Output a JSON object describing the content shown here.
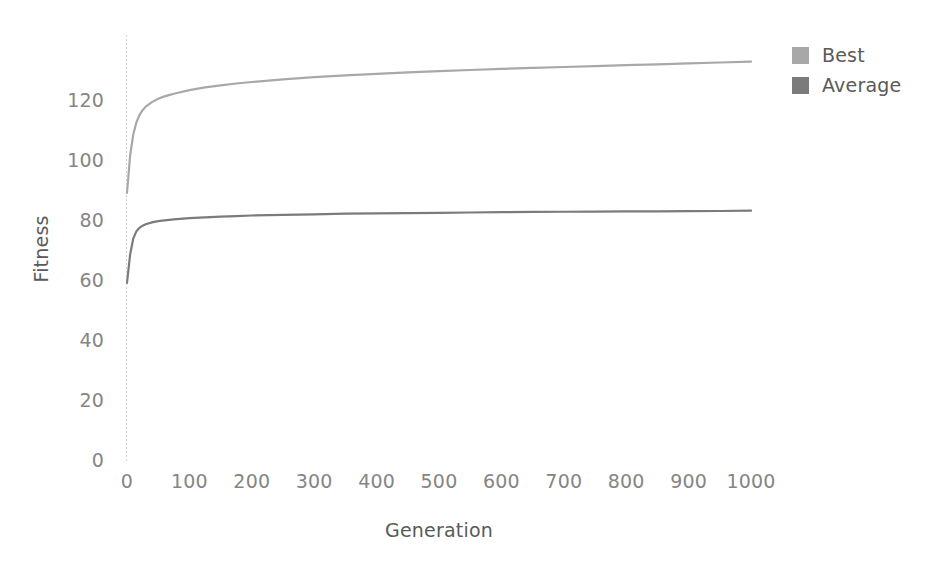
{
  "chart_data": {
    "type": "line",
    "title": "",
    "xlabel": "Generation",
    "ylabel": "Fitness",
    "xlim": [
      0,
      1000
    ],
    "ylim": [
      0,
      140
    ],
    "xticks": [
      "0",
      "100",
      "200",
      "300",
      "400",
      "500",
      "600",
      "700",
      "800",
      "900",
      "1000"
    ],
    "xtick_values": [
      0,
      100,
      200,
      300,
      400,
      500,
      600,
      700,
      800,
      900,
      1000
    ],
    "yticks": [
      "0",
      "20",
      "40",
      "60",
      "80",
      "100",
      "120"
    ],
    "ytick_values": [
      0,
      20,
      40,
      60,
      80,
      100,
      120
    ],
    "grid": false,
    "legend_position": "top-right",
    "x": [
      0,
      5,
      10,
      15,
      20,
      25,
      30,
      40,
      50,
      60,
      75,
      100,
      125,
      150,
      175,
      200,
      250,
      300,
      350,
      400,
      450,
      500,
      550,
      600,
      650,
      700,
      750,
      800,
      850,
      900,
      950,
      1000
    ],
    "series": [
      {
        "name": "Best",
        "color": "#a8a8a8",
        "values": [
          89.0,
          101.5,
          108.5,
          112.5,
          115.0,
          116.6,
          117.8,
          119.3,
          120.4,
          121.2,
          122.1,
          123.3,
          124.2,
          124.9,
          125.5,
          126.0,
          126.9,
          127.6,
          128.2,
          128.7,
          129.2,
          129.6,
          130.0,
          130.4,
          130.7,
          131.0,
          131.3,
          131.6,
          131.9,
          132.2,
          132.5,
          132.8
        ]
      },
      {
        "name": "Average",
        "color": "#7b7b7b",
        "values": [
          59.0,
          68.5,
          73.8,
          76.2,
          77.4,
          78.1,
          78.6,
          79.2,
          79.6,
          79.9,
          80.2,
          80.6,
          80.9,
          81.1,
          81.3,
          81.5,
          81.7,
          81.9,
          82.1,
          82.2,
          82.3,
          82.4,
          82.5,
          82.6,
          82.7,
          82.75,
          82.8,
          82.85,
          82.9,
          82.95,
          83.0,
          83.1
        ]
      }
    ]
  },
  "legend": {
    "items": [
      {
        "label": "Best",
        "color": "#a8a8a8"
      },
      {
        "label": "Average",
        "color": "#7b7b7b"
      }
    ]
  },
  "axes": {
    "x_title": "Generation",
    "y_title": "Fitness"
  },
  "colors": {
    "best": "#a8a8a8",
    "average": "#7b7b7b",
    "axis_line": "#d4d4d4",
    "tick_text": "#858585",
    "title_text": "#5a5a5a",
    "background": "#ffffff"
  }
}
